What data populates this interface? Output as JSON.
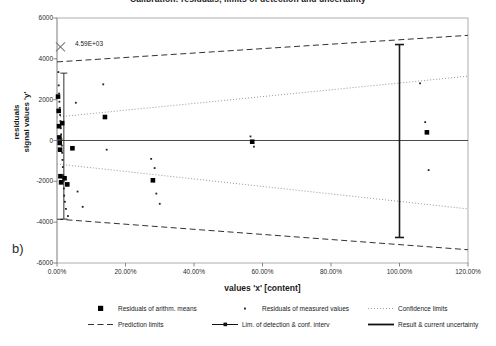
{
  "figure": {
    "title": "Calibration: residuals, limits of detection and uncertainty",
    "panel_label": "b)"
  },
  "annotation": {
    "value_label": "4.59E+03",
    "marker": "x-cross-marker"
  },
  "legend": {
    "items": [
      {
        "key": "square-marker",
        "label": "Residuals of arithm. means"
      },
      {
        "key": "dot-marker",
        "label": "Residuals of measured values"
      },
      {
        "key": "dotted-line",
        "label": "Confidence limits"
      },
      {
        "key": "dashed-line",
        "label": "Prediction limits"
      },
      {
        "key": "capped-line",
        "label": "Lim. of detection & conf. interv"
      },
      {
        "key": "thick-capped-line",
        "label": "Result & current uncertainty"
      }
    ]
  },
  "chart_data": {
    "type": "scatter",
    "title": "Calibration: residuals, limits of detection and uncertainty",
    "xlabel": "values 'x' [content]",
    "ylabel": "residuals signal values 'y'",
    "xlim": [
      0,
      120
    ],
    "ylim": [
      -6000,
      6000
    ],
    "xticks": [
      0,
      20,
      40,
      60,
      80,
      100,
      120
    ],
    "xticklabels": [
      "0.00%",
      "20.00%",
      "40.00%",
      "60.00%",
      "80.00%",
      "100.00%",
      "120.00%"
    ],
    "yticks": [
      6000,
      4000,
      2000,
      0,
      -2000,
      -4000,
      -6000
    ],
    "yticklabels": [
      "6000",
      "4000",
      "2000",
      "0",
      "-2000",
      "-4000",
      "-6000"
    ],
    "grid": false,
    "legend_position": "bottom",
    "series": [
      {
        "name": "Residuals of arithm. means",
        "marker": "square",
        "points": [
          [
            0.3,
            2150
          ],
          [
            0.5,
            1450
          ],
          [
            0.6,
            700
          ],
          [
            0.7,
            150
          ],
          [
            0.8,
            -120
          ],
          [
            0.9,
            -450
          ],
          [
            1.0,
            -1750
          ],
          [
            1.2,
            -2050
          ],
          [
            1.5,
            850
          ],
          [
            2.2,
            -1850
          ],
          [
            3.0,
            -2150
          ],
          [
            4.5,
            -380
          ],
          [
            14.0,
            1150
          ],
          [
            28.0,
            -1950
          ],
          [
            57.0,
            -60
          ],
          [
            108.0,
            400
          ]
        ]
      },
      {
        "name": "Residuals of measured values",
        "marker": "dot",
        "points": [
          [
            0.4,
            3350
          ],
          [
            0.5,
            2700
          ],
          [
            0.6,
            2300
          ],
          [
            0.7,
            1900
          ],
          [
            0.8,
            1600
          ],
          [
            0.9,
            1250
          ],
          [
            1.0,
            950
          ],
          [
            1.1,
            600
          ],
          [
            1.2,
            300
          ],
          [
            1.3,
            60
          ],
          [
            1.4,
            -250
          ],
          [
            1.5,
            -600
          ],
          [
            1.6,
            -950
          ],
          [
            1.7,
            -1300
          ],
          [
            1.8,
            -1700
          ],
          [
            1.9,
            -2000
          ],
          [
            2.0,
            -2350
          ],
          [
            2.1,
            -2700
          ],
          [
            2.3,
            -3000
          ],
          [
            2.6,
            -3350
          ],
          [
            3.2,
            -3700
          ],
          [
            5.5,
            1850
          ],
          [
            6.0,
            -2500
          ],
          [
            7.5,
            -3250
          ],
          [
            13.5,
            2750
          ],
          [
            14.5,
            -450
          ],
          [
            27.5,
            -900
          ],
          [
            28.5,
            -1350
          ],
          [
            29.0,
            -2600
          ],
          [
            30.0,
            -3100
          ],
          [
            56.5,
            200
          ],
          [
            57.5,
            -300
          ],
          [
            106.0,
            2800
          ],
          [
            107.5,
            900
          ],
          [
            108.5,
            -1450
          ]
        ]
      }
    ],
    "bands": [
      {
        "name": "Prediction limits",
        "style": "dashed",
        "upper": [
          [
            0,
            3850
          ],
          [
            120,
            5150
          ]
        ],
        "lower": [
          [
            0,
            -3850
          ],
          [
            120,
            -5350
          ]
        ]
      },
      {
        "name": "Confidence limits",
        "style": "dotted",
        "upper": [
          [
            0,
            1150
          ],
          [
            120,
            3150
          ]
        ],
        "lower": [
          [
            0,
            -1150
          ],
          [
            120,
            -3350
          ]
        ]
      }
    ],
    "markers": [
      {
        "name": "Lim. of detection & conf. interv",
        "style": "capped-vertical",
        "x": 2.0,
        "y_top": 3300,
        "y_bottom": -3850
      },
      {
        "name": "Result & current uncertainty",
        "style": "thick-capped-vertical",
        "x": 100.0,
        "y_top": 4700,
        "y_bottom": -4750
      }
    ],
    "annotations": [
      {
        "text": "4.59E+03",
        "x": 1.0,
        "y": 4590,
        "marker": "x-cross"
      }
    ]
  }
}
